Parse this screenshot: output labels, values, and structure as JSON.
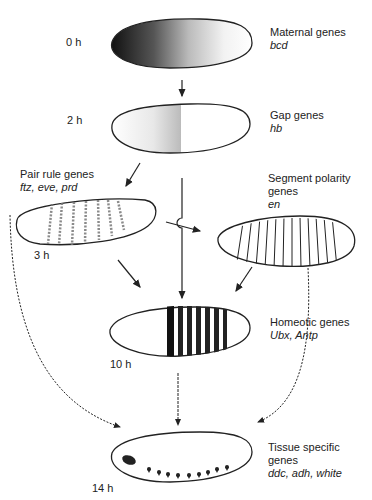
{
  "stages": [
    {
      "id": "maternal",
      "time": "0 h",
      "title": "Maternal genes",
      "genes": "bcd"
    },
    {
      "id": "gap",
      "time": "2 h",
      "title": "Gap genes",
      "genes": "hb"
    },
    {
      "id": "pair_rule",
      "time": "3 h",
      "title": "Pair rule genes",
      "genes": "ftz, eve, prd"
    },
    {
      "id": "segment_polarity",
      "time": "",
      "title_line1": "Segment polarity",
      "title_line2": "genes",
      "genes": "en"
    },
    {
      "id": "homeotic",
      "time": "10 h",
      "title": "Homeotic genes",
      "genes": "Ubx, Antp"
    },
    {
      "id": "tissue_specific",
      "time": "14 h",
      "title_line1": "Tissue specific",
      "title_line2": "genes",
      "genes": "ddc, adh, white"
    }
  ],
  "colors": {
    "ink": "#222222",
    "background": "#ffffff"
  }
}
